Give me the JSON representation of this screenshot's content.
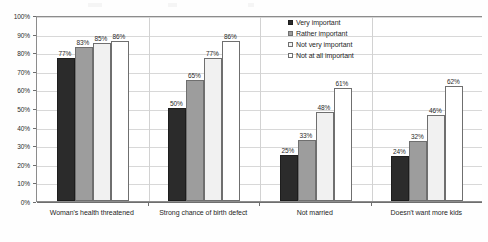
{
  "chart_data": {
    "type": "bar",
    "title": "",
    "subtitle": "",
    "xlabel": "",
    "ylabel": "",
    "ylim": [
      0,
      100
    ],
    "ytick_labels": [
      "0%",
      "10%",
      "20%",
      "30%",
      "40%",
      "50%",
      "60%",
      "70%",
      "80%",
      "90%",
      "100%"
    ],
    "ytick_values": [
      0,
      10,
      20,
      30,
      40,
      50,
      60,
      70,
      80,
      90,
      100
    ],
    "grid": true,
    "grid_axis": "y",
    "legend_position": "top-right",
    "categories": [
      "Woman's health threatened",
      "Strong chance of birth defect",
      "Not married",
      "Doesn't want more kids"
    ],
    "series": [
      {
        "name": "Very important",
        "color": "#2b2b2b",
        "values": [
          77,
          50,
          25,
          24
        ],
        "labels": [
          "77%",
          "50%",
          "25%",
          "24%"
        ]
      },
      {
        "name": "Rather important",
        "color": "#9d9d9d",
        "values": [
          83,
          65,
          33,
          32
        ],
        "labels": [
          "83%",
          "65%",
          "33%",
          "32%"
        ]
      },
      {
        "name": "Not very important",
        "color": "#f1f1f1",
        "values": [
          85,
          77,
          48,
          46
        ],
        "labels": [
          "85%",
          "77%",
          "48%",
          "46%"
        ]
      },
      {
        "name": "Not at all important",
        "color": "#ffffff",
        "values": [
          86,
          86,
          61,
          62
        ],
        "labels": [
          "86%",
          "86%",
          "61%",
          "62%"
        ]
      }
    ]
  },
  "legend": {
    "items": [
      {
        "label": "Very important"
      },
      {
        "label": "Rather important"
      },
      {
        "label": "Not very important"
      },
      {
        "label": "Not at all important"
      }
    ]
  }
}
